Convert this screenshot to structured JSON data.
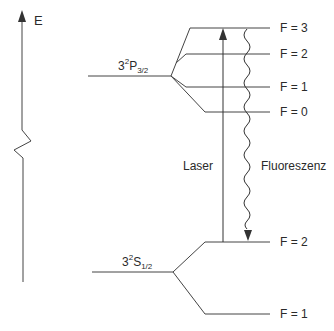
{
  "diagram": {
    "axis": {
      "label": "E"
    },
    "upper_term": {
      "n": "3",
      "mult": "2",
      "L": "P",
      "J": "3/2"
    },
    "lower_term": {
      "n": "3",
      "mult": "2",
      "L": "S",
      "J": "1/2"
    },
    "upper_levels": [
      {
        "label": "F = 3",
        "y": 28
      },
      {
        "label": "F = 2",
        "y": 54
      },
      {
        "label": "F = 1",
        "y": 87
      },
      {
        "label": "F = 0",
        "y": 112
      }
    ],
    "lower_levels": [
      {
        "label": "F = 2",
        "y": 242
      },
      {
        "label": "F = 1",
        "y": 314
      }
    ],
    "transitions": {
      "laser": "Laser",
      "fluorescence": "Fluoreszenz"
    },
    "colors": {
      "line": "#333333",
      "background": "#ffffff"
    }
  }
}
